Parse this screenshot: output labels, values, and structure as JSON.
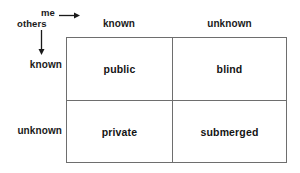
{
  "diagram": {
    "axes": {
      "horizontal": {
        "label": "me",
        "arrow_icon": "arrow-right-icon",
        "categories": [
          "known",
          "unknown"
        ]
      },
      "vertical": {
        "label": "others",
        "arrow_icon": "arrow-down-icon",
        "categories": [
          "known",
          "unknown"
        ]
      }
    },
    "column_headers": [
      "known",
      "unknown"
    ],
    "row_headers": [
      "known",
      "unknown"
    ],
    "cells": [
      [
        {
          "label": "public"
        },
        {
          "label": "blind"
        }
      ],
      [
        {
          "label": "private"
        },
        {
          "label": "submerged"
        }
      ]
    ],
    "colors": {
      "background": "#ffffff",
      "line": "#6e6e6e",
      "text": "#141414"
    }
  }
}
